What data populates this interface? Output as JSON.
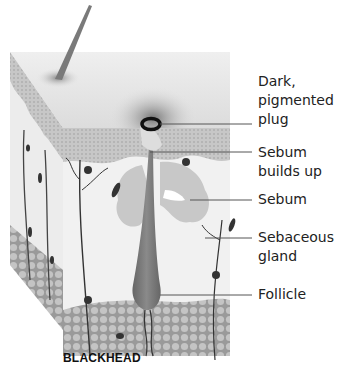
{
  "diagram": {
    "title": "BLACKHEAD",
    "labels": [
      {
        "id": "plug",
        "lines": [
          "Dark,",
          "pigmented",
          "plug"
        ]
      },
      {
        "id": "sebum-builds-up",
        "lines": [
          "Sebum",
          "builds up"
        ]
      },
      {
        "id": "sebum",
        "lines": [
          "Sebum"
        ]
      },
      {
        "id": "sebaceous-gland",
        "lines": [
          "Sebaceous",
          "gland"
        ]
      },
      {
        "id": "follicle",
        "lines": [
          "Follicle"
        ]
      }
    ],
    "colors": {
      "skin_surface": "#e4e4e4",
      "epidermis": "#b8b8b8",
      "dermis": "#eeeeee",
      "fat_layer": "#a8a8a8",
      "follicle": "#777777",
      "plug": "#111111",
      "leader_line": "#555555"
    }
  }
}
